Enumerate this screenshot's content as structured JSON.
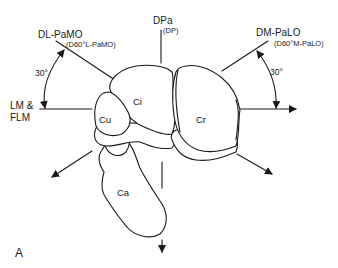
{
  "diagram": {
    "projections": {
      "dl_pamo": {
        "label": "DL-PaMO",
        "sublabel": "(D60°L-PaMO)"
      },
      "dpa": {
        "label": "DPa",
        "sublabel": "(DP)"
      },
      "dm_palo": {
        "label": "DM-PaLO",
        "sublabel": "(D60°M-PaLO)"
      },
      "lm_flm": {
        "label_line1": "LM &",
        "label_line2": "FLM"
      }
    },
    "angles": {
      "left": "30°",
      "right": "30°"
    },
    "bones": {
      "ci": "Ci",
      "cu": "Cu",
      "cr": "Cr",
      "ca": "Ca"
    },
    "panel_label": "A",
    "colors": {
      "line": "#1a1a1a",
      "background": "#ffffff"
    }
  }
}
